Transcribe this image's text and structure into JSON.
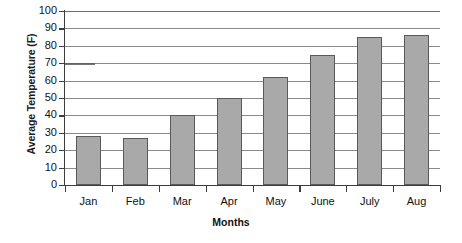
{
  "chart_data": {
    "type": "bar",
    "title": "",
    "xlabel": "Months",
    "ylabel": "Average Temperature (F)",
    "categories": [
      "Jan",
      "Feb",
      "Mar",
      "Apr",
      "May",
      "June",
      "July",
      "Aug"
    ],
    "values": [
      28,
      27,
      40,
      50,
      62,
      75,
      85,
      86
    ],
    "ylim": [
      0,
      100
    ],
    "ytick_step": 10,
    "yticks": [
      0,
      10,
      20,
      30,
      40,
      50,
      60,
      70,
      80,
      90,
      100
    ],
    "ytick_labels": [
      "0",
      "10",
      "20",
      "30",
      "40",
      "50",
      "60",
      "70",
      "80",
      "90",
      "100"
    ],
    "grid": true,
    "grid_axis": "y",
    "legend": false,
    "bar_color": "#a9a9a9",
    "bar_border_color": "#5a5a5a",
    "gridline_color": "#8a8a8a",
    "axis_color": "#3d3d3d",
    "background_color": "#ffffff"
  }
}
